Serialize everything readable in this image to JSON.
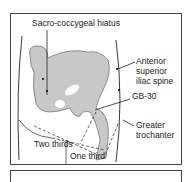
{
  "diagram": {
    "labels": {
      "sacro": "Sacro-coccygeal hiatus",
      "asis_1": "Anterior",
      "asis_2": "superior",
      "asis_3": "iliac spine",
      "gb30": "GB-30",
      "gt_1": "Greater",
      "gt_2": "trochanter",
      "two_thirds": "Two thirds",
      "one_third": "One third"
    },
    "colors": {
      "bone": "#c8c8c8",
      "line": "#222222",
      "frame": "#444444"
    }
  }
}
